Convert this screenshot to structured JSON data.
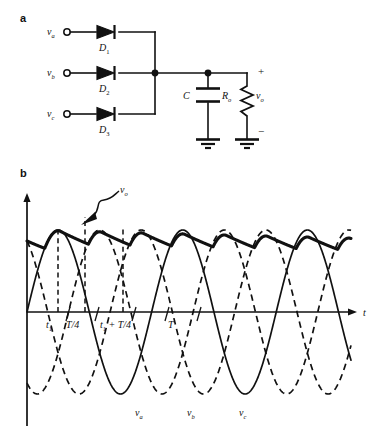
{
  "figure": {
    "panels": [
      {
        "letter": "a",
        "caption": "three-phase half-wave rectifier circuit with capacitor filter"
      },
      {
        "letter": "b",
        "caption": "phase voltages and filtered output voltage waveforms"
      }
    ]
  },
  "circuit": {
    "inputs": [
      {
        "id": "va",
        "label": "v",
        "sub": "a",
        "diode": "D",
        "diode_sub": "1"
      },
      {
        "id": "vb",
        "label": "v",
        "sub": "b",
        "diode": "D",
        "diode_sub": "2"
      },
      {
        "id": "vc",
        "label": "v",
        "sub": "c",
        "diode": "D",
        "diode_sub": "3"
      }
    ],
    "capacitor": {
      "label": "C"
    },
    "resistor": {
      "label": "R",
      "sub": "o"
    },
    "output": {
      "label": "v",
      "sub": "o",
      "plus": "+",
      "minus": "−"
    },
    "icons": [
      "diode-icon",
      "capacitor-icon",
      "resistor-icon",
      "ground-icon",
      "terminal-icon"
    ]
  },
  "chart_data": {
    "type": "line",
    "title": "",
    "xlabel": "t",
    "ylabel": "",
    "xlim": [
      0,
      5.2
    ],
    "ylim": [
      -1.25,
      1.25
    ],
    "grid": false,
    "legend": "inline-labels",
    "axis_labels": {
      "x": "t"
    },
    "tick_labels": [
      {
        "text": "t",
        "sub": "1",
        "x": 0.333
      },
      {
        "text": "T/4",
        "sub": "",
        "x": 0.75
      },
      {
        "text": "t",
        "sub": "1",
        "tail": " + T/4",
        "x": 1.333
      },
      {
        "text": "T",
        "sub": "",
        "x": 2.333
      }
    ],
    "annotations": [
      {
        "name": "vo-callout",
        "text": "v",
        "sub": "o",
        "points_to": "output envelope"
      }
    ],
    "series": [
      {
        "name": "v_a",
        "label": "v",
        "sub": "a",
        "style": "solid",
        "phase_deg": 0,
        "amplitude": 1.0,
        "period": 2.0,
        "color": "#111111"
      },
      {
        "name": "v_b",
        "label": "v",
        "sub": "b",
        "style": "dashed",
        "phase_deg": -120,
        "amplitude": 1.0,
        "period": 2.0,
        "color": "#111111"
      },
      {
        "name": "v_c",
        "label": "v",
        "sub": "c",
        "style": "dashed",
        "phase_deg": -240,
        "amplitude": 1.0,
        "period": 2.0,
        "color": "#111111"
      },
      {
        "name": "v_o",
        "label": "v",
        "sub": "o",
        "style": "thick-solid",
        "description": "rectified peak envelope with capacitor discharge ripple, slowly decaying",
        "color": "#111111"
      }
    ],
    "series_labels_x": [
      1.62,
      2.45,
      3.28
    ]
  }
}
